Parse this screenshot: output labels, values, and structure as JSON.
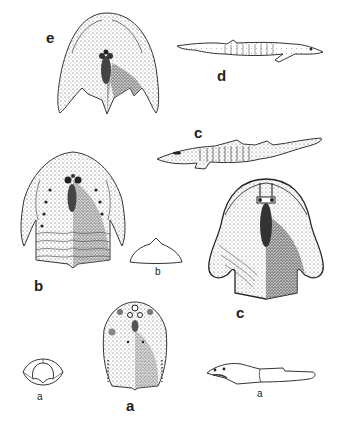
{
  "plate": {
    "background": "#ffffff",
    "ink": "#2a2a2a",
    "figures": [
      {
        "id": "e",
        "label": "e",
        "description": "dorsal head shield with cornual processes"
      },
      {
        "id": "d",
        "label": "d",
        "description": "lateral view of whole fish, head pointing right"
      },
      {
        "id": "c_side",
        "label": "c",
        "description": "lateral view of whole fish, head pointing left"
      },
      {
        "id": "b",
        "label": "b",
        "description": "dorsal head shield with segmented trunk"
      },
      {
        "id": "b_cross",
        "label": "b",
        "description": "cross-section of shield"
      },
      {
        "id": "c",
        "label": "c",
        "description": "broad dorsal head shield with rounded cornua"
      },
      {
        "id": "a_cross",
        "label": "a",
        "description": "cross-section of head"
      },
      {
        "id": "a",
        "label": "a",
        "description": "oval dorsal head shield"
      },
      {
        "id": "a_side",
        "label": "a",
        "description": "lateral view outline of fish"
      }
    ]
  }
}
